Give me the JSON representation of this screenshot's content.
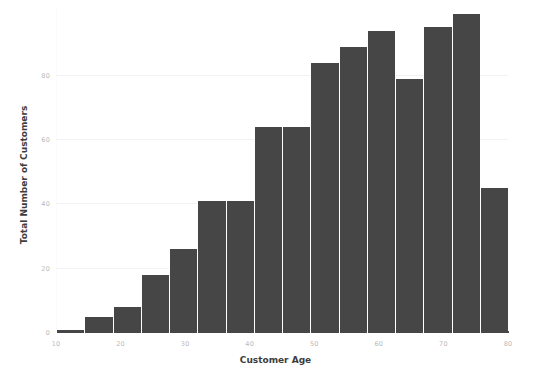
{
  "chart_data": {
    "type": "bar",
    "title": "",
    "xlabel": "Customer Age",
    "ylabel": "Total Number of Customers",
    "xlim": [
      10,
      80
    ],
    "ylim": [
      0,
      101
    ],
    "grid": true,
    "legend": null,
    "bar_color": "#464646",
    "grid_color": "#f2f2f2",
    "tick_color": "#b9b9b9",
    "label_color": "#3d3d3d",
    "xticks": [
      "10",
      "20",
      "30",
      "40",
      "50",
      "60",
      "70",
      "80"
    ],
    "xtick_values": [
      10,
      20,
      30,
      40,
      50,
      60,
      70,
      80
    ],
    "yticks": [
      "0",
      "20",
      "40",
      "60",
      "80"
    ],
    "ytick_values": [
      0,
      20,
      40,
      60,
      80
    ],
    "bin_edges": [
      10.0,
      14.375,
      18.75,
      23.125,
      27.5,
      31.875,
      36.25,
      40.625,
      45.0,
      49.375,
      53.75,
      58.125,
      62.5,
      66.875,
      71.25,
      75.625,
      80.0
    ],
    "categories": [
      "10-14.4",
      "14.4-18.8",
      "18.8-23.1",
      "23.1-27.5",
      "27.5-31.9",
      "31.9-36.3",
      "36.3-40.6",
      "40.6-45",
      "45-49.4",
      "49.4-53.8",
      "53.8-58.1",
      "58.1-62.5",
      "62.5-66.9",
      "66.9-71.3",
      "71.3-75.6",
      "75.6-80"
    ],
    "values": [
      1,
      5,
      8,
      18,
      26,
      41,
      41,
      64,
      64,
      84,
      89,
      94,
      79,
      95,
      99,
      45
    ]
  }
}
